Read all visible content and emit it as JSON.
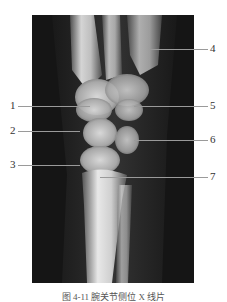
{
  "figure": {
    "image_alt": "Lateral wrist X-ray radiograph",
    "labels": [
      {
        "id": "1",
        "text": "1",
        "side": "left",
        "y": 106
      },
      {
        "id": "2",
        "text": "2",
        "side": "left",
        "y": 131
      },
      {
        "id": "3",
        "text": "3",
        "side": "left",
        "y": 165
      },
      {
        "id": "4",
        "text": "4",
        "side": "right",
        "y": 49
      },
      {
        "id": "5",
        "text": "5",
        "side": "right",
        "y": 106
      },
      {
        "id": "6",
        "text": "6",
        "side": "right",
        "y": 140
      },
      {
        "id": "7",
        "text": "7",
        "side": "right",
        "y": 177
      }
    ],
    "caption": "图 4-11 腕关节侧位 X 线片"
  }
}
